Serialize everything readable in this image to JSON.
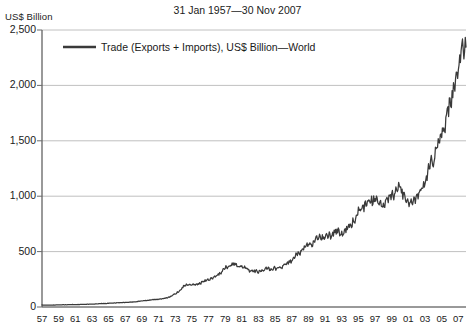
{
  "chart_data": {
    "type": "line",
    "title": "31 Jan 1957—30 Nov 2007",
    "ylabel": "US$ Billion",
    "xlabel": "",
    "grid": true,
    "legend_position": "top-left-inside",
    "ylim": [
      0,
      2500
    ],
    "yticks": [
      0,
      500,
      1000,
      1500,
      2000,
      2500
    ],
    "ytick_labels": [
      "0",
      "500",
      "1,000",
      "1,500",
      "2,000",
      "2,500"
    ],
    "xlim": [
      1957,
      2007.92
    ],
    "xticks": [
      1957,
      1959,
      1961,
      1963,
      1965,
      1967,
      1969,
      1971,
      1973,
      1975,
      1977,
      1979,
      1981,
      1983,
      1985,
      1987,
      1989,
      1991,
      1993,
      1995,
      1997,
      1999,
      2001,
      2003,
      2005,
      2007
    ],
    "xtick_labels": [
      "57",
      "59",
      "61",
      "63",
      "65",
      "67",
      "69",
      "71",
      "73",
      "75",
      "77",
      "79",
      "81",
      "83",
      "85",
      "87",
      "89",
      "91",
      "93",
      "95",
      "97",
      "99",
      "01",
      "03",
      "05",
      "07"
    ],
    "series": [
      {
        "name": "Trade (Exports + Imports), US$ Billion—World",
        "color": "#3a3a3a",
        "x": [
          1957.0,
          1957.5,
          1958.0,
          1958.5,
          1959.0,
          1959.5,
          1960.0,
          1960.5,
          1961.0,
          1961.5,
          1962.0,
          1962.5,
          1963.0,
          1963.5,
          1964.0,
          1964.5,
          1965.0,
          1965.5,
          1966.0,
          1966.5,
          1967.0,
          1967.5,
          1968.0,
          1968.5,
          1969.0,
          1969.5,
          1970.0,
          1970.5,
          1971.0,
          1971.5,
          1972.0,
          1972.5,
          1973.0,
          1973.5,
          1974.0,
          1974.5,
          1975.0,
          1975.5,
          1976.0,
          1976.5,
          1977.0,
          1977.5,
          1978.0,
          1978.5,
          1979.0,
          1979.5,
          1980.0,
          1980.5,
          1981.0,
          1981.5,
          1982.0,
          1982.5,
          1983.0,
          1983.5,
          1984.0,
          1984.5,
          1985.0,
          1985.5,
          1986.0,
          1986.5,
          1987.0,
          1987.5,
          1988.0,
          1988.5,
          1989.0,
          1989.5,
          1990.0,
          1990.5,
          1991.0,
          1991.5,
          1992.0,
          1992.5,
          1993.0,
          1993.5,
          1994.0,
          1994.5,
          1995.0,
          1995.5,
          1996.0,
          1996.5,
          1997.0,
          1997.5,
          1998.0,
          1998.5,
          1999.0,
          1999.5,
          2000.0,
          2000.5,
          2001.0,
          2001.5,
          2002.0,
          2002.5,
          2003.0,
          2003.5,
          2004.0,
          2004.5,
          2005.0,
          2005.5,
          2006.0,
          2006.5,
          2007.0,
          2007.5,
          2007.92
        ],
        "y": [
          18,
          18,
          17,
          18,
          19,
          20,
          21,
          22,
          22,
          23,
          24,
          25,
          26,
          28,
          30,
          32,
          34,
          35,
          38,
          40,
          41,
          43,
          46,
          50,
          55,
          59,
          63,
          66,
          70,
          74,
          85,
          95,
          120,
          145,
          185,
          205,
          195,
          200,
          215,
          230,
          250,
          265,
          290,
          310,
          350,
          375,
          385,
          375,
          370,
          350,
          330,
          320,
          320,
          330,
          345,
          350,
          345,
          355,
          370,
          395,
          430,
          460,
          500,
          530,
          560,
          580,
          620,
          640,
          630,
          645,
          670,
          680,
          665,
          690,
          740,
          790,
          860,
          900,
          910,
          960,
          975,
          950,
          930,
          955,
          1000,
          1050,
          1060,
          1020,
          930,
          945,
          990,
          1060,
          1150,
          1260,
          1340,
          1450,
          1560,
          1680,
          1820,
          1980,
          2180,
          2300,
          2345
        ]
      }
    ],
    "annotations": []
  },
  "legend": {
    "label": "Trade (Exports + Imports), US$ Billion—World"
  },
  "plot_geometry": {
    "left": 42,
    "right": 466,
    "top": 30,
    "bottom": 307
  }
}
